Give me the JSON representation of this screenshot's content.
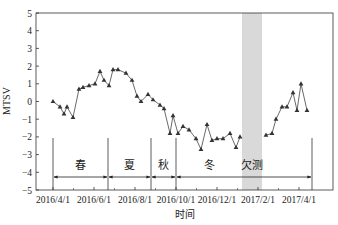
{
  "chart_data": {
    "type": "line",
    "title": "",
    "xlabel": "时间",
    "ylabel": "MTSV",
    "ylim": [
      -5,
      5
    ],
    "yticks": [
      -5,
      -4,
      -3,
      -2,
      -1,
      0,
      1,
      2,
      3,
      4,
      5
    ],
    "xtick_labels": [
      "2016/4/1",
      "2016/6/1",
      "2016/8/1",
      "2016/10/1",
      "2016/12/1",
      "2017/2/1",
      "2017/4/1"
    ],
    "grid": false,
    "marker": "triangle",
    "series": [
      {
        "name": "MTSV",
        "segments": [
          [
            {
              "x": 53,
              "y": 0.0
            },
            {
              "x": 60,
              "y": -0.3
            },
            {
              "x": 64,
              "y": -0.7
            },
            {
              "x": 67,
              "y": -0.3
            },
            {
              "x": 73,
              "y": -0.9
            },
            {
              "x": 79,
              "y": 0.7
            },
            {
              "x": 83,
              "y": 0.8
            },
            {
              "x": 89,
              "y": 0.9
            },
            {
              "x": 95,
              "y": 1.0
            },
            {
              "x": 100,
              "y": 1.7
            },
            {
              "x": 104,
              "y": 1.2
            },
            {
              "x": 109,
              "y": 0.9
            },
            {
              "x": 113,
              "y": 1.8
            },
            {
              "x": 118,
              "y": 1.8
            },
            {
              "x": 126,
              "y": 1.6
            },
            {
              "x": 132,
              "y": 1.2
            },
            {
              "x": 137,
              "y": 0.3
            },
            {
              "x": 141,
              "y": 0.0
            },
            {
              "x": 148,
              "y": 0.4
            },
            {
              "x": 153,
              "y": 0.1
            },
            {
              "x": 160,
              "y": -0.2
            },
            {
              "x": 164,
              "y": -0.4
            },
            {
              "x": 170,
              "y": -1.8
            },
            {
              "x": 173,
              "y": -0.8
            },
            {
              "x": 178,
              "y": -1.8
            },
            {
              "x": 183,
              "y": -1.4
            },
            {
              "x": 189,
              "y": -1.6
            },
            {
              "x": 196,
              "y": -2.1
            },
            {
              "x": 201,
              "y": -2.7
            },
            {
              "x": 207,
              "y": -1.3
            },
            {
              "x": 212,
              "y": -2.2
            },
            {
              "x": 217,
              "y": -2.1
            },
            {
              "x": 223,
              "y": -2.1
            },
            {
              "x": 230,
              "y": -1.8
            },
            {
              "x": 236,
              "y": -2.6
            },
            {
              "x": 240,
              "y": -2.0
            }
          ],
          [
            {
              "x": 266,
              "y": -1.9
            },
            {
              "x": 272,
              "y": -1.8
            },
            {
              "x": 276,
              "y": -1.0
            },
            {
              "x": 282,
              "y": -0.3
            },
            {
              "x": 287,
              "y": -0.3
            },
            {
              "x": 293,
              "y": 0.5
            },
            {
              "x": 297,
              "y": -0.5
            },
            {
              "x": 301,
              "y": 1.0
            },
            {
              "x": 307,
              "y": -0.5
            }
          ]
        ]
      }
    ],
    "annotations": {
      "seasons": [
        {
          "label": "春",
          "from_x": 53,
          "to_x": 108
        },
        {
          "label": "夏",
          "from_x": 108,
          "to_x": 151
        },
        {
          "label": "秋",
          "from_x": 151,
          "to_x": 176
        },
        {
          "label": "冬",
          "from_x": 176,
          "to_x": 312
        }
      ],
      "missing_band": {
        "label": "欠测",
        "from_x": 242,
        "to_x": 262
      }
    }
  }
}
